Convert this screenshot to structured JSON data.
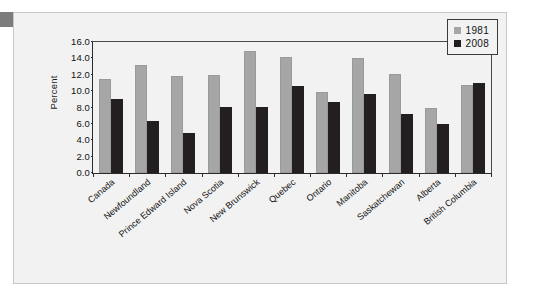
{
  "chart_data": {
    "type": "bar",
    "title": "",
    "subtitle": "",
    "xlabel": "",
    "ylabel": "Percent",
    "ylim": [
      0.0,
      16.0
    ],
    "ytick_step": 2.0,
    "ytick_labels": [
      "16.0",
      "14.0",
      "12.0",
      "10.0",
      "8.0",
      "6.0",
      "4.0",
      "2.0",
      "0.0"
    ],
    "ytick_values": [
      16.0,
      14.0,
      12.0,
      10.0,
      8.0,
      6.0,
      4.0,
      2.0,
      0.0
    ],
    "grid": false,
    "legend_position": "top-right",
    "categories": [
      "Canada",
      "Newfoundland",
      "Prince Edward Island",
      "Nova Scotia",
      "New Brunswick",
      "Quebec",
      "Ontario",
      "Manitoba",
      "Saskatchewan",
      "Alberta",
      "British Columbia"
    ],
    "series": [
      {
        "name": "1981",
        "color": "#a6a6a6",
        "values": [
          11.5,
          13.2,
          11.9,
          12.0,
          14.9,
          14.2,
          9.9,
          14.1,
          12.1,
          7.9,
          10.7
        ]
      },
      {
        "name": "2008",
        "color": "#231f20",
        "values": [
          9.1,
          6.4,
          4.9,
          8.1,
          8.1,
          10.6,
          8.7,
          9.7,
          7.2,
          6.0,
          11.0
        ]
      }
    ]
  },
  "legend": {
    "entries": [
      {
        "label": "1981",
        "swatch": "legend-swatch-1981"
      },
      {
        "label": "2008",
        "swatch": "legend-swatch-2008"
      }
    ]
  },
  "colors": {
    "series_1981": "#a6a6a6",
    "series_2008": "#231f20",
    "panel_background": "#f2f2f2",
    "page_background": "#ffffff",
    "frame_border": "#c8c8c8",
    "axis_line": "#2b2b2b",
    "corner_tab": "#7c7c7c"
  }
}
